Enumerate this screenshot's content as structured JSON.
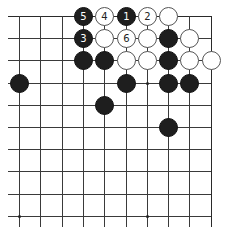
{
  "diagram": {
    "type": "go-board-fragment",
    "columns": 10,
    "rows": 10,
    "edges": {
      "top": true,
      "right": true,
      "left": false,
      "bottom": false
    },
    "star_points": [
      {
        "col": 6,
        "row": 3
      },
      {
        "col": 0,
        "row": 9
      },
      {
        "col": 6,
        "row": 9
      }
    ],
    "stones": [
      {
        "col": 3,
        "row": 0,
        "color": "black",
        "label": "5"
      },
      {
        "col": 4,
        "row": 0,
        "color": "white",
        "label": "4"
      },
      {
        "col": 5,
        "row": 0,
        "color": "black",
        "label": "1"
      },
      {
        "col": 6,
        "row": 0,
        "color": "white",
        "label": "2"
      },
      {
        "col": 7,
        "row": 0,
        "color": "white",
        "label": ""
      },
      {
        "col": 3,
        "row": 1,
        "color": "black",
        "label": "3"
      },
      {
        "col": 4,
        "row": 1,
        "color": "white",
        "label": ""
      },
      {
        "col": 5,
        "row": 1,
        "color": "white",
        "label": "6"
      },
      {
        "col": 6,
        "row": 1,
        "color": "white",
        "label": ""
      },
      {
        "col": 7,
        "row": 1,
        "color": "black",
        "label": ""
      },
      {
        "col": 8,
        "row": 1,
        "color": "white",
        "label": ""
      },
      {
        "col": 3,
        "row": 2,
        "color": "black",
        "label": ""
      },
      {
        "col": 4,
        "row": 2,
        "color": "black",
        "label": ""
      },
      {
        "col": 5,
        "row": 2,
        "color": "white",
        "label": ""
      },
      {
        "col": 6,
        "row": 2,
        "color": "white",
        "label": ""
      },
      {
        "col": 7,
        "row": 2,
        "color": "black",
        "label": ""
      },
      {
        "col": 8,
        "row": 2,
        "color": "white",
        "label": ""
      },
      {
        "col": 9,
        "row": 2,
        "color": "white",
        "label": ""
      },
      {
        "col": 0,
        "row": 3,
        "color": "black",
        "label": ""
      },
      {
        "col": 5,
        "row": 3,
        "color": "black",
        "label": ""
      },
      {
        "col": 7,
        "row": 3,
        "color": "black",
        "label": ""
      },
      {
        "col": 8,
        "row": 3,
        "color": "black",
        "label": ""
      },
      {
        "col": 4,
        "row": 4,
        "color": "black",
        "label": ""
      },
      {
        "col": 7,
        "row": 5,
        "color": "black",
        "label": ""
      }
    ],
    "colors": {
      "black_stone": "#1e1e1e",
      "white_stone": "#ffffff",
      "grid": "#3a3a3a",
      "background": "#ffffff"
    }
  }
}
